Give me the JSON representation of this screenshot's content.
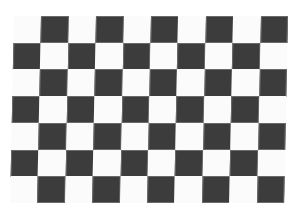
{
  "image": {
    "subject": "checkerboard calibration pattern",
    "board": {
      "columns": 10,
      "rows": 7,
      "left": 14,
      "top": 16,
      "cell_width": 27.4,
      "cell_height": 26.7,
      "dark_parity": "odd",
      "colors": {
        "dark": "#3c3c3c",
        "light": "#fbfbfb",
        "background": "#ffffff"
      }
    }
  }
}
